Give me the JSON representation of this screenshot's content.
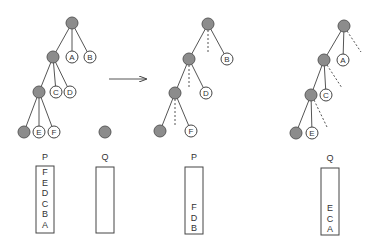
{
  "diagram": {
    "trees": [
      {
        "id": "left",
        "nodes": [
          {
            "id": "r",
            "x": 72,
            "y": 23,
            "type": "gray"
          },
          {
            "id": "n1",
            "x": 53,
            "y": 57,
            "type": "gray"
          },
          {
            "id": "A",
            "x": 72,
            "y": 57,
            "type": "leaf",
            "label": "A"
          },
          {
            "id": "B",
            "x": 90,
            "y": 57,
            "type": "leaf",
            "label": "B"
          },
          {
            "id": "n2",
            "x": 39,
            "y": 92,
            "type": "gray"
          },
          {
            "id": "C",
            "x": 56,
            "y": 92,
            "type": "leaf",
            "label": "C"
          },
          {
            "id": "D",
            "x": 70,
            "y": 92,
            "type": "leaf",
            "label": "D"
          },
          {
            "id": "n3",
            "x": 24,
            "y": 132,
            "type": "gray"
          },
          {
            "id": "E",
            "x": 39,
            "y": 132,
            "type": "leaf",
            "label": "E"
          },
          {
            "id": "F",
            "x": 54,
            "y": 132,
            "type": "leaf",
            "label": "F"
          }
        ],
        "edges": [
          [
            "r",
            "n1",
            "solid"
          ],
          [
            "r",
            "A",
            "solid"
          ],
          [
            "r",
            "B",
            "solid"
          ],
          [
            "n1",
            "n2",
            "solid"
          ],
          [
            "n1",
            "C",
            "solid"
          ],
          [
            "n1",
            "D",
            "solid"
          ],
          [
            "n2",
            "n3",
            "solid"
          ],
          [
            "n2",
            "E",
            "solid"
          ],
          [
            "n2",
            "F",
            "solid"
          ]
        ]
      },
      {
        "id": "middle",
        "nodes": [
          {
            "id": "r",
            "x": 208,
            "y": 24,
            "type": "gray"
          },
          {
            "id": "n1",
            "x": 189,
            "y": 59,
            "type": "gray"
          },
          {
            "id": "B",
            "x": 227,
            "y": 59,
            "type": "leaf",
            "label": "B"
          },
          {
            "id": "n2",
            "x": 175,
            "y": 93,
            "type": "gray"
          },
          {
            "id": "D",
            "x": 206,
            "y": 93,
            "type": "leaf",
            "label": "D"
          },
          {
            "id": "n3",
            "x": 160,
            "y": 131,
            "type": "gray"
          },
          {
            "id": "F",
            "x": 191,
            "y": 131,
            "type": "leaf",
            "label": "F"
          }
        ],
        "edges": [
          [
            "r",
            "n1",
            "solid"
          ],
          [
            "r",
            "B",
            "solid"
          ],
          [
            "n1",
            "n2",
            "solid"
          ],
          [
            "n1",
            "D",
            "solid"
          ],
          [
            "n2",
            "n3",
            "solid"
          ],
          [
            "n2",
            "F",
            "solid"
          ]
        ],
        "dashed": [
          [
            208,
            30,
            208,
            53
          ],
          [
            189,
            65,
            189,
            87
          ],
          [
            175,
            99,
            175,
            125
          ]
        ]
      },
      {
        "id": "right",
        "nodes": [
          {
            "id": "r",
            "x": 344,
            "y": 26,
            "type": "gray"
          },
          {
            "id": "n1",
            "x": 324,
            "y": 60,
            "type": "gray"
          },
          {
            "id": "A",
            "x": 343,
            "y": 60,
            "type": "leaf",
            "label": "A"
          },
          {
            "id": "n2",
            "x": 311,
            "y": 95,
            "type": "gray"
          },
          {
            "id": "C",
            "x": 326,
            "y": 95,
            "type": "leaf",
            "label": "C"
          },
          {
            "id": "n3",
            "x": 296,
            "y": 133,
            "type": "gray"
          },
          {
            "id": "E",
            "x": 312,
            "y": 133,
            "type": "leaf",
            "label": "E"
          }
        ],
        "edges": [
          [
            "r",
            "n1",
            "solid"
          ],
          [
            "r",
            "A",
            "solid"
          ],
          [
            "n1",
            "n2",
            "solid"
          ],
          [
            "n1",
            "C",
            "solid"
          ],
          [
            "n2",
            "n3",
            "solid"
          ],
          [
            "n2",
            "E",
            "solid"
          ]
        ],
        "dashed": [
          [
            347,
            31,
            361,
            52
          ],
          [
            327,
            65,
            342,
            88
          ],
          [
            314,
            100,
            327,
            127
          ]
        ]
      }
    ],
    "extra_nodes": [
      {
        "id": "Q-root",
        "x": 105,
        "y": 132,
        "type": "gray"
      }
    ],
    "arrow": {
      "x1": 109,
      "y1": 79,
      "x2": 146,
      "y2": 79
    },
    "stacks": [
      {
        "name": "P",
        "label_x": 45,
        "label_y": 160,
        "x": 36,
        "y": 166,
        "w": 18,
        "h": 67,
        "items": [
          "F",
          "E",
          "D",
          "C",
          "B",
          "A"
        ],
        "align": "top"
      },
      {
        "name": "Q",
        "label_x": 105,
        "label_y": 160,
        "x": 96,
        "y": 167,
        "w": 18,
        "h": 66,
        "items": [],
        "align": "top"
      },
      {
        "name": "P",
        "label_x": 194,
        "label_y": 160,
        "x": 185,
        "y": 167,
        "w": 18,
        "h": 67,
        "items": [
          "F",
          "D",
          "B"
        ],
        "align": "bottom"
      },
      {
        "name": "Q",
        "label_x": 330,
        "label_y": 161,
        "x": 321,
        "y": 168,
        "w": 18,
        "h": 67,
        "items": [
          "E",
          "C",
          "A"
        ],
        "align": "bottom"
      }
    ],
    "colors": {
      "gray_node": "#8c8c8c",
      "stroke": "#444444",
      "background": "#ffffff"
    }
  }
}
